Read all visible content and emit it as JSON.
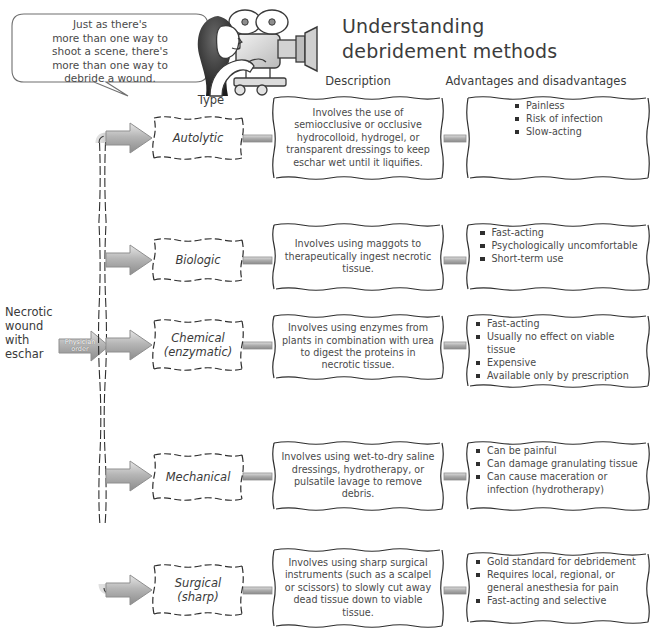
{
  "title": {
    "line1": "Understanding",
    "line2": "debridement methods"
  },
  "speech_bubble": {
    "lines": [
      "Just as there's",
      "more than one way to",
      "shoot a scene, there's",
      "more than one way to",
      "debride a wound."
    ]
  },
  "illustration": {
    "name": "woman-filming-with-movie-camera"
  },
  "column_headers": {
    "type": "Type",
    "description": "Description",
    "advantages": "Advantages and disadvantages"
  },
  "source": {
    "label_lines": [
      "Necrotic",
      "wound",
      "with",
      "eschar"
    ],
    "arrow_label_lines": [
      "Physician",
      "order"
    ]
  },
  "rows": [
    {
      "type_lines": [
        "Autolytic"
      ],
      "description": "Involves the use of semiocclusive or occlusive hydrocolloid, hydrogel, or transparent dressings to keep eschar wet until it liquifies.",
      "advantages": [
        "Painless",
        "Risk of infection",
        "Slow-acting"
      ]
    },
    {
      "type_lines": [
        "Biologic"
      ],
      "description": "Involves using maggots to therapeutically ingest necrotic tissue.",
      "advantages": [
        "Fast-acting",
        "Psychologically uncomfortable",
        "Short-term use"
      ]
    },
    {
      "type_lines": [
        "Chemical",
        "(enzymatic)"
      ],
      "description": "Involves using enzymes from plants in combination with urea to digest the proteins in necrotic tissue.",
      "advantages": [
        "Fast-acting",
        "Usually no effect on viable tissue",
        "Expensive",
        "Available only by prescription"
      ]
    },
    {
      "type_lines": [
        "Mechanical"
      ],
      "description": "Involves using wet-to-dry saline dressings, hydrotherapy, or pulsatile lavage to remove debris.",
      "advantages": [
        "Can be painful",
        "Can damage granulating tissue",
        "Can cause maceration or infection (hydrotherapy)"
      ]
    },
    {
      "type_lines": [
        "Surgical",
        "(sharp)"
      ],
      "description": "Involves using sharp surgical instruments (such as a scalpel or scissors) to slowly cut away dead tissue down to viable tissue.",
      "advantages": [
        "Gold standard for debridement",
        "Requires local, regional, or general anesthesia for pain",
        "Fast-acting and selective"
      ]
    }
  ],
  "colors": {
    "ink": "#3a3a3a",
    "body_text": "#4a4a4a",
    "bullet": "#2f2f2f",
    "arrow_dark": "#8d8d8d",
    "arrow_light": "#d8d8d8",
    "background": "#ffffff"
  }
}
